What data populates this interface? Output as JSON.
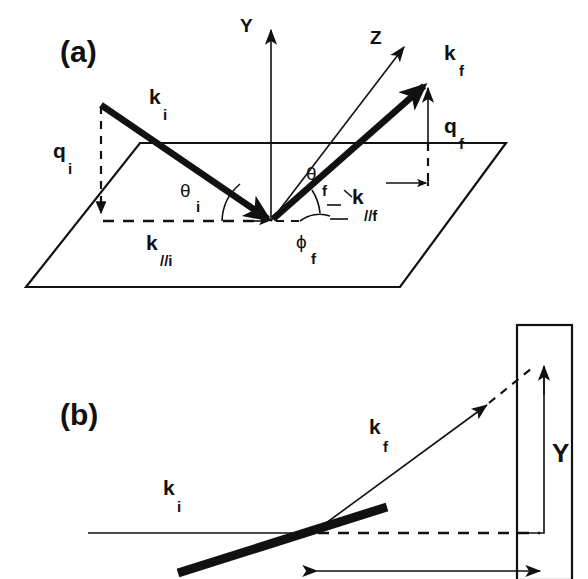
{
  "figure": {
    "kind": "scattering-geometry-schematic",
    "background_color": "#ffffff",
    "ink_color": "#111111",
    "width": 588,
    "height": 579
  },
  "panel_a": {
    "label": "(a)",
    "axes": [
      {
        "name": "Y",
        "label": "Y",
        "direction": "vertical-up"
      },
      {
        "name": "Z",
        "label": "Z",
        "direction": "diagonal-up-right"
      }
    ],
    "vectors": [
      {
        "name": "k_i",
        "label": "k",
        "subscript": "i",
        "style": "thick-incoming"
      },
      {
        "name": "k_f",
        "label": "k",
        "subscript": "f",
        "style": "thick-outgoing"
      },
      {
        "name": "q_i",
        "label": "q",
        "subscript": "i",
        "style": "dashed-down-arrow"
      },
      {
        "name": "q_f",
        "label": "q",
        "subscript": "f",
        "style": "thin-up-arrow"
      },
      {
        "name": "k_parallel_i",
        "label": "k",
        "subscript": "//i",
        "style": "dashed-in-plane"
      },
      {
        "name": "k_parallel_f",
        "label": "k",
        "subscript": "//f",
        "style": "dashed-in-plane"
      }
    ],
    "angles": [
      {
        "name": "theta_i",
        "label": "θ",
        "subscript": "i"
      },
      {
        "name": "theta_f",
        "label": "θ",
        "subscript": "f"
      },
      {
        "name": "phi_f",
        "label": "ϕ",
        "subscript": "f"
      }
    ],
    "surface": {
      "name": "sample-plane",
      "shape": "parallelogram"
    }
  },
  "panel_b": {
    "label": "(b)",
    "vectors": [
      {
        "name": "k_i",
        "label": "k",
        "subscript": "i",
        "style": "thin-horizontal-incoming"
      },
      {
        "name": "k_f",
        "label": "k",
        "subscript": "f",
        "style": "thin-diagonal-outgoing"
      }
    ],
    "axes": [
      {
        "name": "Y",
        "label": "Y",
        "direction": "vertical-up"
      }
    ],
    "elements": [
      {
        "name": "sample-bar",
        "style": "thick-tilted-line"
      },
      {
        "name": "detector-screen",
        "style": "tall-rectangle"
      },
      {
        "name": "reference-line",
        "style": "dashed-horizontal"
      },
      {
        "name": "distance-arrow",
        "style": "double-headed-horizontal"
      }
    ]
  }
}
